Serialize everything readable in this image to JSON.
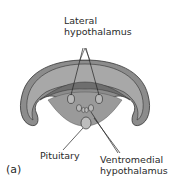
{
  "diagram": {
    "type": "anatomical cross-section",
    "panel_label": "(a)",
    "labels": {
      "lateral_line1": "Lateral",
      "lateral_line2": "hypothalamus",
      "pituitary": "Pituitary",
      "ventromedial_line1": "Ventromedial",
      "ventromedial_line2": "hypothalamus"
    },
    "colors": {
      "outer_tissue": "#8c8c8c",
      "inner_tissue": "#a8a8a8",
      "dark_band": "#6e6e6e",
      "outline": "#333333",
      "background": "#ffffff"
    }
  }
}
